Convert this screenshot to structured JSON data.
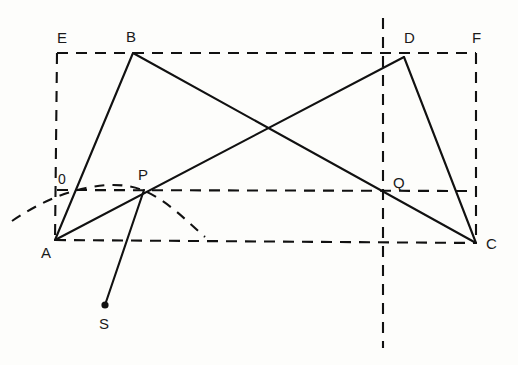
{
  "figure": {
    "canvas": {
      "width": 518,
      "height": 365
    },
    "background_color": "#fdfdfb",
    "line_color": "#111111"
  },
  "labels": {
    "origin": "0",
    "a": "A",
    "b": "B",
    "c": "C",
    "d": "D",
    "e": "E",
    "f": "F",
    "p": "P",
    "q": "Q",
    "s": "S"
  },
  "points": {
    "A": {
      "x": 55,
      "y": 240
    },
    "B": {
      "x": 133,
      "y": 53
    },
    "C": {
      "x": 476,
      "y": 243
    },
    "D": {
      "x": 404,
      "y": 57
    },
    "E": {
      "x": 57,
      "y": 53
    },
    "F": {
      "x": 476,
      "y": 53
    },
    "P": {
      "x": 144,
      "y": 190
    },
    "Q": {
      "x": 383,
      "y": 190
    },
    "S": {
      "x": 105,
      "y": 305
    },
    "O": {
      "x": 57,
      "y": 190
    }
  },
  "solid_segments": [
    {
      "name": "segment-A-B",
      "from": "A",
      "to": "B"
    },
    {
      "name": "segment-B-C",
      "from": "B",
      "to": "C"
    },
    {
      "name": "segment-A-D",
      "from": "A",
      "to": "D"
    },
    {
      "name": "segment-D-C",
      "from": "D",
      "to": "C"
    },
    {
      "name": "segment-P-S",
      "from": "P",
      "to": "S"
    }
  ],
  "dashed_segments": [
    {
      "name": "rect-top-E-F",
      "from": "E",
      "to": "F"
    },
    {
      "name": "rect-left-E-A",
      "from": "E",
      "to": "A"
    },
    {
      "name": "rect-right-F-C",
      "from": "F",
      "to": "C"
    },
    {
      "name": "rect-bottom-A-C",
      "from": "A",
      "to": "C"
    },
    {
      "name": "midline-P-Q-right",
      "from": "P",
      "to": "C-edge"
    },
    {
      "name": "vertical-axis",
      "from": "top",
      "to": "bottom"
    }
  ],
  "dashed_curve": {
    "name": "arc-through-P",
    "description": "dashed arc rising from lower-left, passing through P, descending to baseline"
  },
  "markers": {
    "s_endpoint_dot": true
  }
}
